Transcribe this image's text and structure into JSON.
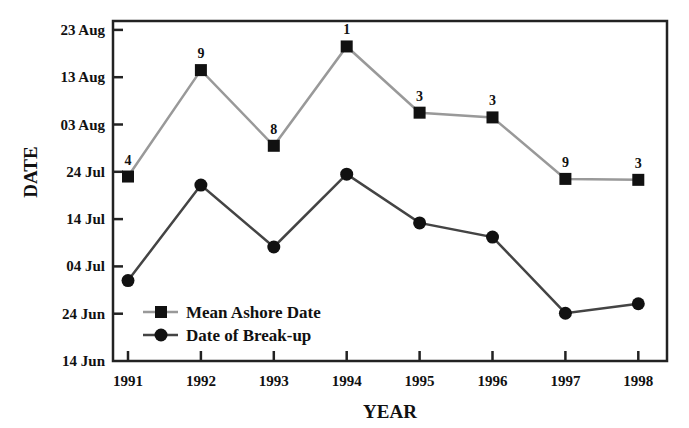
{
  "chart_data": {
    "type": "line",
    "title": "",
    "xlabel": "YEAR",
    "ylabel": "DATE",
    "x": [
      "1991",
      "1992",
      "1993",
      "1994",
      "1995",
      "1996",
      "1997",
      "1998"
    ],
    "yticks": [
      "14 Jun",
      "24 Jun",
      "04 Jul",
      "14 Jul",
      "24 Jul",
      "03 Aug",
      "13 Aug",
      "23 Aug"
    ],
    "ylim": [
      "14 Jun",
      "25 Aug"
    ],
    "grid": false,
    "legend_position": "lower left",
    "series": [
      {
        "name": "Mean Ashore Date",
        "marker": "square",
        "color": "#999999",
        "values": [
          "23 Jul",
          "14 Aug",
          "29 Jul",
          "19 Aug",
          "05 Aug",
          "04 Aug",
          "22 Jul",
          "22 Jul"
        ],
        "days_after_14_Jun": [
          39,
          61.5,
          45.5,
          66.5,
          52.5,
          51.5,
          38.5,
          38.3
        ],
        "annotations": [
          "4",
          "9",
          "8",
          "1",
          "3",
          "3",
          "9",
          "3"
        ]
      },
      {
        "name": "Date of Break-up",
        "marker": "circle",
        "color": "#444444",
        "values": [
          "01 Jul",
          "21 Jul",
          "08 Jul",
          "23 Jul",
          "13 Jul",
          "10 Jul",
          "24 Jun",
          "26 Jun"
        ],
        "days_after_14_Jun": [
          17,
          37.2,
          24.1,
          39.5,
          29.2,
          26.2,
          10.1,
          12.1
        ]
      }
    ]
  }
}
